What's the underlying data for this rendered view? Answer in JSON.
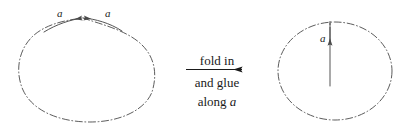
{
  "figure": {
    "title": "fold in and glue along a",
    "stroke_color": "#4a4a4a",
    "text_color": "#1a1a1a",
    "background": "#ffffff",
    "width": 405,
    "height": 130
  },
  "left_shape": {
    "name": "closed curve with cusp",
    "edge_label_left": "a",
    "edge_label_right": "a",
    "arrow_left_direction": "toward-apex",
    "arrow_right_direction": "toward-apex",
    "line_style": "dash-dot"
  },
  "caption": {
    "line1": "fold in",
    "line2": "and glue",
    "line3_prefix": "along ",
    "line3_italic": "a",
    "arrow": "right-arrow"
  },
  "right_shape": {
    "name": "ellipse with interior slit",
    "slit_label": "a",
    "slit_arrow_direction": "down",
    "line_style": "dash-dot"
  }
}
